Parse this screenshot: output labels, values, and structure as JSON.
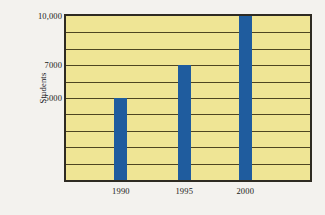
{
  "chart_data": {
    "type": "bar",
    "title": "",
    "subtitle": "",
    "xlabel": "",
    "ylabel": "Students",
    "categories": [
      "1990",
      "1995",
      "2000"
    ],
    "values": [
      5000,
      7000,
      10000
    ],
    "series": [
      {
        "name": "Students",
        "values": [
          5000,
          7000,
          10000
        ]
      }
    ],
    "ylim": [
      0,
      10000
    ],
    "y_tick_values": [
      5000,
      7000,
      10000
    ],
    "y_tick_labels": [
      "5000",
      "7000",
      "10,000"
    ],
    "gridline_values": [
      1000,
      2000,
      3000,
      4000,
      5000,
      6000,
      7000,
      8000,
      9000
    ],
    "grid": true,
    "grid_axis": "y",
    "legend": false,
    "legend_position": "none",
    "bar_color": "#1f5c9e",
    "plot_background_color": "#efe595",
    "gridline_color": "#4e4521",
    "frame_color": "#2e2b22",
    "figure_background_color": "#f3f2ee",
    "annotations": []
  },
  "figure": {
    "y_axis_title": "Students"
  }
}
